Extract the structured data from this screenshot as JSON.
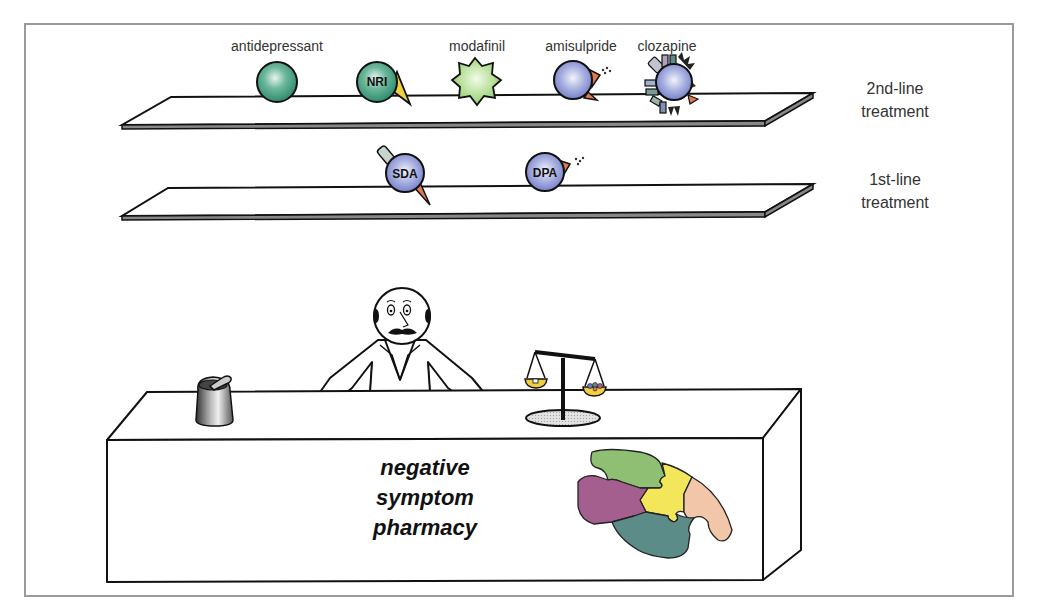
{
  "diagram": {
    "title": "negative symptom pharmacy",
    "shelves": [
      {
        "id": "second-line",
        "label_line1": "2nd-line",
        "label_line2": "treatment",
        "items": [
          {
            "label": "antidepressant",
            "type": "plain-sphere",
            "color": "#3d9a7e"
          },
          {
            "label": "",
            "badge": "NRI",
            "type": "sphere-with-yellow-cone",
            "color": "#3d9a7e",
            "accent": "#f0d040"
          },
          {
            "label": "modafinil",
            "type": "star-sphere",
            "color": "#a7d68e"
          },
          {
            "label": "amisulpride",
            "type": "sphere-with-orange-cone-dots",
            "color": "#8c97d6",
            "accent": "#e07a50"
          },
          {
            "label": "clozapine",
            "type": "spiked-multi-receptor-sphere",
            "color": "#8c97d6",
            "accent": "#e07a50"
          }
        ]
      },
      {
        "id": "first-line",
        "label_line1": "1st-line",
        "label_line2": "treatment",
        "items": [
          {
            "badge": "SDA",
            "type": "sphere-with-tab-and-cone",
            "color": "#8c97d6",
            "accent": "#e07a50"
          },
          {
            "badge": "DPA",
            "type": "sphere-with-orange-cone-dots",
            "color": "#8c97d6",
            "accent": "#e07a50"
          }
        ]
      }
    ],
    "counter": {
      "line1": "negative",
      "line2": "symptom",
      "line3": "pharmacy"
    },
    "props": [
      "pharmacist",
      "mortar-and-pestle",
      "balance-scale",
      "brain-puzzle"
    ],
    "puzzle_colors": [
      "#8fbf73",
      "#f3e65a",
      "#f2c6a8",
      "#a55f8e",
      "#5c8c88"
    ]
  }
}
